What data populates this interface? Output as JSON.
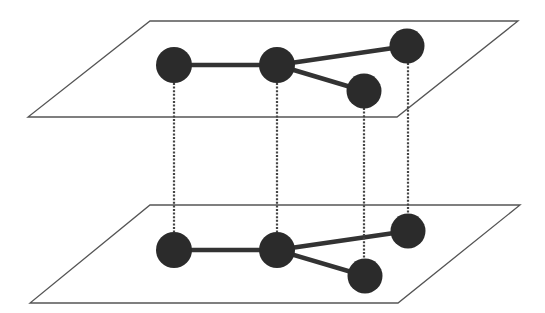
{
  "diagram": {
    "colors": {
      "background": "#ffffff",
      "plane_stroke": "#555555",
      "node_fill": "#2b2b2b",
      "edge_stroke": "#333333",
      "interlayer_link": "#444444"
    },
    "planes": [
      {
        "id": "top",
        "points": [
          [
            150,
            21
          ],
          [
            518,
            21
          ],
          [
            397,
            117
          ],
          [
            28,
            117
          ]
        ]
      },
      {
        "id": "bottom",
        "points": [
          [
            150,
            205
          ],
          [
            520,
            205
          ],
          [
            398,
            303
          ],
          [
            30,
            303
          ]
        ]
      }
    ],
    "layers": [
      {
        "id": "top",
        "nodes": [
          {
            "id": "n1",
            "x": 174,
            "y": 65,
            "r": 18
          },
          {
            "id": "n2",
            "x": 277,
            "y": 65,
            "r": 18
          },
          {
            "id": "n3",
            "x": 364,
            "y": 91,
            "r": 17.5
          },
          {
            "id": "n4",
            "x": 407,
            "y": 46,
            "r": 17.5
          }
        ],
        "edges": [
          [
            "n1",
            "n2"
          ],
          [
            "n2",
            "n3"
          ],
          [
            "n2",
            "n4"
          ]
        ]
      },
      {
        "id": "bottom",
        "nodes": [
          {
            "id": "n1",
            "x": 174,
            "y": 250,
            "r": 18
          },
          {
            "id": "n2",
            "x": 277,
            "y": 250,
            "r": 18
          },
          {
            "id": "n3",
            "x": 365,
            "y": 276,
            "r": 17.5
          },
          {
            "id": "n4",
            "x": 408,
            "y": 231,
            "r": 17.5
          }
        ],
        "edges": [
          [
            "n1",
            "n2"
          ],
          [
            "n2",
            "n3"
          ],
          [
            "n2",
            "n4"
          ]
        ]
      }
    ],
    "interlayer_links": [
      {
        "node": "n1",
        "x": 174,
        "y1": 83,
        "y2": 232
      },
      {
        "node": "n2",
        "x": 277,
        "y1": 83,
        "y2": 232
      },
      {
        "node": "n3",
        "x": 364,
        "y1": 108,
        "y2": 258
      },
      {
        "node": "n4",
        "x": 408,
        "y1": 63,
        "y2": 214
      }
    ]
  }
}
